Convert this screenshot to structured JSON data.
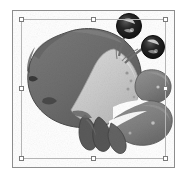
{
  "window": {
    "title": "Selected Image Object",
    "background_color": "#ffffff"
  },
  "object_frame": {
    "name": "image-object-frame",
    "border_color": "#8d8d8d",
    "fill_color": "#ffffff",
    "x": 12,
    "y": 10,
    "width": 163,
    "height": 158
  },
  "selection": {
    "state": "selected",
    "rect_color": "#b5b5b5",
    "rect": {
      "x": 21,
      "y": 19,
      "width": 145,
      "height": 140
    },
    "handle_fill": "#ffffff",
    "handle_border": "#7a7a7a",
    "handle_size": 5,
    "handles": [
      {
        "id": "nw",
        "label": "top-left-resize-handle",
        "x": 19,
        "y": 17
      },
      {
        "id": "n",
        "label": "top-center-resize-handle",
        "x": 91,
        "y": 17
      },
      {
        "id": "ne",
        "label": "top-right-resize-handle",
        "x": 163,
        "y": 17
      },
      {
        "id": "w",
        "label": "middle-left-resize-handle",
        "x": 19,
        "y": 86
      },
      {
        "id": "e",
        "label": "middle-right-resize-handle",
        "x": 163,
        "y": 86
      },
      {
        "id": "sw",
        "label": "bottom-left-resize-handle",
        "x": 19,
        "y": 156
      },
      {
        "id": "s",
        "label": "bottom-center-resize-handle",
        "x": 91,
        "y": 156
      },
      {
        "id": "se",
        "label": "bottom-right-resize-handle",
        "x": 163,
        "y": 156
      }
    ]
  },
  "artwork": {
    "name": "crab-illustration",
    "subject": "crab",
    "style": "grayscale halftone clipart",
    "alt_text": "Grayscale illustration of a crab with two stalked eyes and a large claw",
    "palette": {
      "shell_dark": "#6e6e6e",
      "shell_shadow": "#4a4a4a",
      "shell_mid": "#7d7d7d",
      "belly_light": "#c6c6c6",
      "belly_highlight": "#d6d6d6",
      "claw_gray": "#8a8a8a",
      "claw_dark": "#636363",
      "leg_dark": "#5a5a5a",
      "eye_black": "#1a1a1a",
      "eye_highlight": "#f2f2f2",
      "outline": "#3d3d3d",
      "paper": "#ffffff"
    },
    "parts": [
      {
        "id": "carapace",
        "label": "crab-carapace",
        "tone": "#6e6e6e"
      },
      {
        "id": "belly",
        "label": "crab-abdomen",
        "tone": "#c6c6c6"
      },
      {
        "id": "eye-left",
        "label": "crab-eye-upper",
        "tone": "#1a1a1a"
      },
      {
        "id": "eye-right",
        "label": "crab-eye-lower",
        "tone": "#1a1a1a"
      },
      {
        "id": "eyestalks",
        "label": "crab-eye-stalks",
        "tone": "#7d7d7d"
      },
      {
        "id": "claw-upper",
        "label": "crab-claw-upper",
        "tone": "#8a8a8a"
      },
      {
        "id": "claw-lower",
        "label": "crab-claw-lower",
        "tone": "#7a7a7a"
      },
      {
        "id": "legs",
        "label": "crab-walking-legs",
        "tone": "#5a5a5a"
      }
    ]
  }
}
